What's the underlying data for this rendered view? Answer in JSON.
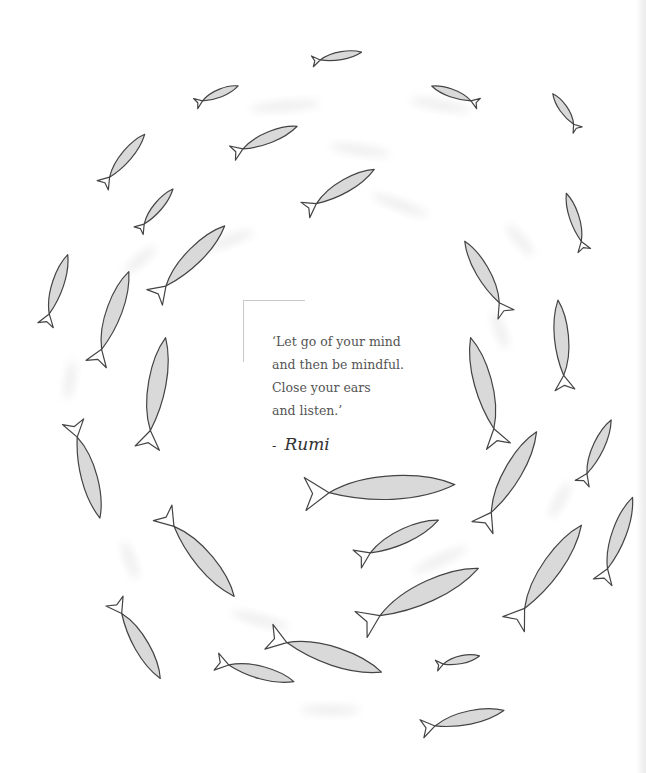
{
  "quote": {
    "lines": [
      "‘Let go of your mind",
      "and then be mindful.",
      "Close your ears",
      "and listen.’"
    ],
    "dash": "-",
    "author": "Rumi"
  },
  "colors": {
    "background": "#ffffff",
    "fish_outline": "#444444",
    "fish_fill": "#d9d9d9",
    "shadow": "#eeeeee",
    "text": "#555555",
    "frame": "#c9c9c9"
  },
  "fish": [
    {
      "x": 337,
      "y": 57,
      "len": 50,
      "angle": -10,
      "flip": false
    },
    {
      "x": 217,
      "y": 95,
      "len": 46,
      "angle": -22,
      "flip": false
    },
    {
      "x": 455,
      "y": 95,
      "len": 50,
      "angle": 20,
      "flip": true
    },
    {
      "x": 565,
      "y": 112,
      "len": 44,
      "angle": 55,
      "flip": true
    },
    {
      "x": 265,
      "y": 140,
      "len": 70,
      "angle": -22,
      "flip": false
    },
    {
      "x": 124,
      "y": 160,
      "len": 66,
      "angle": -50,
      "flip": false
    },
    {
      "x": 340,
      "y": 190,
      "len": 80,
      "angle": -30,
      "flip": false
    },
    {
      "x": 156,
      "y": 210,
      "len": 54,
      "angle": -50,
      "flip": false
    },
    {
      "x": 575,
      "y": 222,
      "len": 60,
      "angle": 72,
      "flip": true
    },
    {
      "x": 190,
      "y": 262,
      "len": 100,
      "angle": -45,
      "flip": false
    },
    {
      "x": 485,
      "y": 278,
      "len": 84,
      "angle": 60,
      "flip": true
    },
    {
      "x": 57,
      "y": 290,
      "len": 74,
      "angle": -72,
      "flip": false
    },
    {
      "x": 113,
      "y": 318,
      "len": 98,
      "angle": -70,
      "flip": false
    },
    {
      "x": 561,
      "y": 345,
      "len": 90,
      "angle": 85,
      "flip": true
    },
    {
      "x": 157,
      "y": 393,
      "len": 112,
      "angle": -80,
      "flip": false
    },
    {
      "x": 484,
      "y": 392,
      "len": 112,
      "angle": 75,
      "flip": true
    },
    {
      "x": 597,
      "y": 452,
      "len": 70,
      "angle": -65,
      "flip": false
    },
    {
      "x": 86,
      "y": 470,
      "len": 100,
      "angle": 75,
      "flip": false
    },
    {
      "x": 510,
      "y": 480,
      "len": 110,
      "angle": -60,
      "flip": false
    },
    {
      "x": 380,
      "y": 490,
      "len": 150,
      "angle": -3,
      "flip": false
    },
    {
      "x": 618,
      "y": 540,
      "len": 90,
      "angle": -70,
      "flip": false
    },
    {
      "x": 398,
      "y": 540,
      "len": 90,
      "angle": -25,
      "flip": false
    },
    {
      "x": 198,
      "y": 555,
      "len": 110,
      "angle": 50,
      "flip": false
    },
    {
      "x": 548,
      "y": 575,
      "len": 120,
      "angle": -55,
      "flip": false
    },
    {
      "x": 420,
      "y": 597,
      "len": 130,
      "angle": -25,
      "flip": false
    },
    {
      "x": 137,
      "y": 640,
      "len": 90,
      "angle": 60,
      "flip": false
    },
    {
      "x": 325,
      "y": 655,
      "len": 118,
      "angle": 18,
      "flip": false
    },
    {
      "x": 255,
      "y": 672,
      "len": 80,
      "angle": 15,
      "flip": false
    },
    {
      "x": 458,
      "y": 661,
      "len": 44,
      "angle": -12,
      "flip": false
    },
    {
      "x": 463,
      "y": 720,
      "len": 84,
      "angle": -12,
      "flip": false
    }
  ],
  "shadows": [
    {
      "x": 285,
      "y": 106,
      "w": 70,
      "angle": -5
    },
    {
      "x": 440,
      "y": 105,
      "w": 60,
      "angle": 10
    },
    {
      "x": 360,
      "y": 150,
      "w": 60,
      "angle": 8
    },
    {
      "x": 400,
      "y": 205,
      "w": 60,
      "angle": 20
    },
    {
      "x": 230,
      "y": 240,
      "w": 50,
      "angle": -20
    },
    {
      "x": 520,
      "y": 240,
      "w": 40,
      "angle": 50
    },
    {
      "x": 140,
      "y": 260,
      "w": 40,
      "angle": -40
    },
    {
      "x": 70,
      "y": 380,
      "w": 40,
      "angle": -80
    },
    {
      "x": 500,
      "y": 330,
      "w": 40,
      "angle": 70
    },
    {
      "x": 440,
      "y": 560,
      "w": 60,
      "angle": -25
    },
    {
      "x": 260,
      "y": 620,
      "w": 60,
      "angle": 15
    },
    {
      "x": 330,
      "y": 710,
      "w": 60,
      "angle": 0
    },
    {
      "x": 130,
      "y": 560,
      "w": 40,
      "angle": 70
    },
    {
      "x": 560,
      "y": 500,
      "w": 40,
      "angle": -60
    }
  ]
}
